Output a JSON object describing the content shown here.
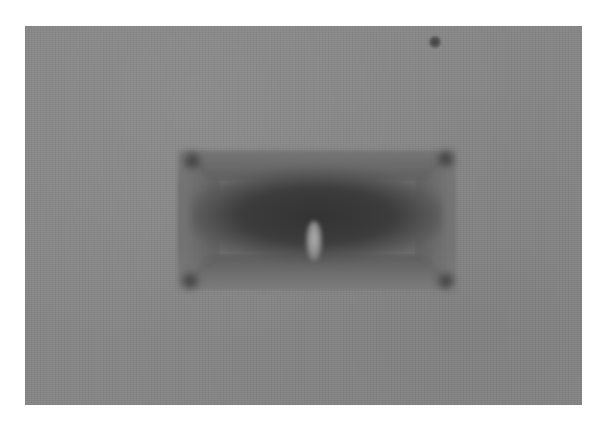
{
  "image": {
    "description": "Grayscale micrograph of a rectangular indentation mark",
    "colors": {
      "page_background": "#ffffff",
      "surface": "#878787",
      "indent_interior": "#333333",
      "highlight": "#b0b0b0",
      "speck": "#3f3f3f"
    },
    "features": [
      {
        "name": "rectangular-indentation",
        "bounds": [
          178,
          150,
          455,
          290
        ]
      },
      {
        "name": "central-highlight",
        "center": [
          306,
          230
        ]
      },
      {
        "name": "dust-speck",
        "center": [
          431,
          42
        ]
      }
    ]
  }
}
